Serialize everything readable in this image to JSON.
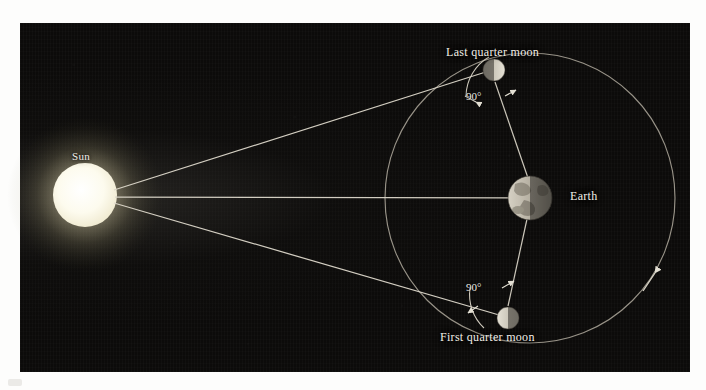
{
  "figure": {
    "panel": {
      "background_color": "#0c0b0a",
      "left": 20,
      "top": 23,
      "width": 670,
      "height": 349
    }
  },
  "labels": {
    "sun": "Sun",
    "earth": "Earth",
    "last_quarter_moon": "Last quarter moon",
    "first_quarter_moon": "First quarter moon"
  },
  "angles": {
    "top": "90°",
    "bottom": "90°"
  },
  "bodies": [
    {
      "id": "sun",
      "name": "Sun",
      "cx": 85,
      "cy": 195,
      "r": 32,
      "color": "#fffdf2",
      "glow_color": "#fff8d8",
      "lit_from": "self-luminous"
    },
    {
      "id": "earth",
      "name": "Earth",
      "cx": 530,
      "cy": 198,
      "r": 22,
      "color": "#b9b4a8",
      "lit_from": "left",
      "terminator": "vertical"
    },
    {
      "id": "last-quarter-moon",
      "name": "Last quarter moon",
      "cx": 494,
      "cy": 70,
      "r": 11,
      "color": "#cfcabd",
      "lit_from": "right",
      "terminator": "vertical"
    },
    {
      "id": "first-quarter-moon",
      "name": "First quarter moon",
      "cx": 508,
      "cy": 318,
      "r": 11,
      "color": "#cfcabd",
      "lit_from": "left",
      "terminator": "vertical"
    }
  ],
  "orbit": {
    "center_x": 530,
    "center_y": 198,
    "radius": 145,
    "stroke_color": "#a9a396",
    "direction": "counterclockwise",
    "direction_arrow_angle_deg": 52
  },
  "sunrays": [
    {
      "id": "ray-to-last-quarter",
      "from": [
        117,
        193
      ],
      "to": [
        492,
        71
      ]
    },
    {
      "id": "ray-to-earth",
      "from": [
        117,
        197
      ],
      "to": [
        530,
        198
      ]
    },
    {
      "id": "ray-to-first-quarter",
      "from": [
        117,
        202
      ],
      "to": [
        506,
        317
      ]
    }
  ],
  "sightlines": [
    {
      "id": "earth-to-last-quarter",
      "from": [
        530,
        198
      ],
      "to": [
        494,
        81
      ]
    },
    {
      "id": "earth-to-first-quarter",
      "from": [
        530,
        198
      ],
      "to": [
        508,
        307
      ]
    }
  ],
  "colors": {
    "line": "#d8d3c6",
    "text": "#f2efe8",
    "background": "#0c0b0a",
    "page": "#fdfdfc"
  }
}
